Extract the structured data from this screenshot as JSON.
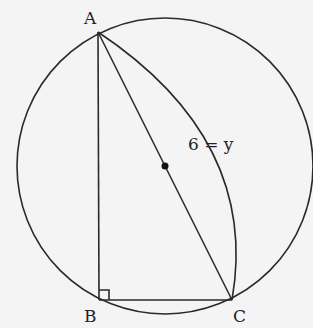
{
  "diagram": {
    "type": "geometry",
    "points": {
      "A": "A",
      "B": "B",
      "C": "C"
    },
    "arc_label": "6 = y",
    "right_angle_at": "B",
    "center_marked": true,
    "colors": {
      "stroke": "#2a2a2a",
      "background": "#f4f4f4"
    }
  }
}
